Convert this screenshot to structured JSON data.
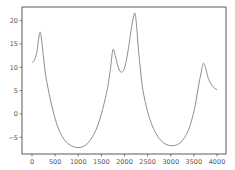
{
  "chart_data": {
    "type": "line",
    "title": "",
    "xlabel": "",
    "ylabel": "",
    "xlim": [
      -200,
      4200
    ],
    "ylim": [
      -8,
      23
    ],
    "grid": false,
    "legend": null,
    "xticks": [
      0,
      500,
      1000,
      1500,
      2000,
      2500,
      3000,
      3500,
      4000
    ],
    "yticks": [
      -5,
      0,
      5,
      10,
      15,
      20
    ],
    "series": [
      {
        "name": "series",
        "color": "#808080",
        "x": [
          0,
          50,
          100,
          150,
          175,
          200,
          250,
          300,
          400,
          500,
          600,
          700,
          800,
          900,
          1000,
          1100,
          1200,
          1300,
          1400,
          1500,
          1600,
          1650,
          1700,
          1750,
          1800,
          1850,
          1900,
          1950,
          2000,
          2050,
          2100,
          2150,
          2200,
          2230,
          2260,
          2300,
          2350,
          2400,
          2500,
          2600,
          2700,
          2800,
          2900,
          3000,
          3100,
          3200,
          3300,
          3400,
          3500,
          3550,
          3600,
          3650,
          3700,
          3750,
          3800,
          3850,
          3900,
          3950,
          4000
        ],
        "y": [
          11,
          11.5,
          13,
          16.5,
          17.5,
          16.5,
          12,
          8,
          3,
          -1,
          -3.8,
          -5.5,
          -6.5,
          -7,
          -7.2,
          -7,
          -6.3,
          -5,
          -3,
          0,
          4,
          6.5,
          10,
          13.8,
          12.5,
          10.5,
          9.2,
          9,
          9.8,
          12,
          15,
          18.5,
          21,
          21.5,
          19,
          14,
          9,
          5,
          0.5,
          -2.5,
          -4.5,
          -5.8,
          -6.5,
          -6.8,
          -6.7,
          -6.2,
          -5,
          -3,
          0.5,
          3,
          6,
          8.5,
          10.8,
          10,
          8,
          6.8,
          6,
          5.5,
          5.2
        ]
      }
    ]
  }
}
